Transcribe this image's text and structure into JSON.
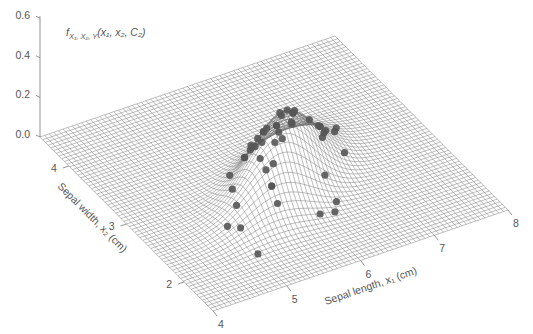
{
  "chart_data": {
    "type": "surface3d+scatter",
    "title": "",
    "zlabel": "f_{X1,X2,Y}(x1, x2, C2)",
    "zlabel_parts": {
      "f": "f",
      "sub": "X₁, X₂, Y",
      "args": "(x₁, x₂, C₂)"
    },
    "xlabel": "Sepal length, x₁ (cm)",
    "ylabel": "Sepal width, x₂ (cm)",
    "x_ticks": [
      4,
      5,
      6,
      7,
      8
    ],
    "y_ticks": [
      2,
      3,
      4
    ],
    "z_ticks": [
      "0.0",
      "0.2",
      "0.4",
      "0.6"
    ],
    "xlim": [
      4,
      8
    ],
    "ylim": [
      1.5,
      4.5
    ],
    "zlim": [
      0,
      0.6
    ],
    "surface": {
      "kind": "bivariate gaussian density",
      "mean": [
        5.94,
        2.77
      ],
      "std": [
        0.52,
        0.31
      ],
      "corr": 0.53,
      "peak": 0.37,
      "grid_color": "#6e6e6e"
    },
    "points_color": "#555555",
    "points_label": "Class C2 samples (Versicolor)",
    "points": [
      [
        7.0,
        3.2
      ],
      [
        6.4,
        3.2
      ],
      [
        6.9,
        3.1
      ],
      [
        5.5,
        2.3
      ],
      [
        6.5,
        2.8
      ],
      [
        5.7,
        2.8
      ],
      [
        6.3,
        3.3
      ],
      [
        4.9,
        2.4
      ],
      [
        6.6,
        2.9
      ],
      [
        5.2,
        2.7
      ],
      [
        5.0,
        2.0
      ],
      [
        5.9,
        3.0
      ],
      [
        6.0,
        2.2
      ],
      [
        6.1,
        2.9
      ],
      [
        5.6,
        2.9
      ],
      [
        6.7,
        3.1
      ],
      [
        5.6,
        3.0
      ],
      [
        5.8,
        2.7
      ],
      [
        6.2,
        2.2
      ],
      [
        5.6,
        2.5
      ],
      [
        5.9,
        3.2
      ],
      [
        6.1,
        2.8
      ],
      [
        6.3,
        2.5
      ],
      [
        6.1,
        2.8
      ],
      [
        6.4,
        2.9
      ],
      [
        6.6,
        3.0
      ],
      [
        6.8,
        2.8
      ],
      [
        6.7,
        3.0
      ],
      [
        6.0,
        2.9
      ],
      [
        5.7,
        2.6
      ],
      [
        5.5,
        2.4
      ],
      [
        5.5,
        2.4
      ],
      [
        5.8,
        2.7
      ],
      [
        6.0,
        2.7
      ],
      [
        5.4,
        3.0
      ],
      [
        6.0,
        3.4
      ],
      [
        6.7,
        3.1
      ],
      [
        6.3,
        2.3
      ],
      [
        5.6,
        3.0
      ],
      [
        5.5,
        2.5
      ],
      [
        5.5,
        2.6
      ],
      [
        6.1,
        3.0
      ],
      [
        5.8,
        2.6
      ],
      [
        5.0,
        2.3
      ],
      [
        5.6,
        2.7
      ],
      [
        5.7,
        3.0
      ],
      [
        5.7,
        2.9
      ],
      [
        6.2,
        2.9
      ],
      [
        5.1,
        2.5
      ],
      [
        5.7,
        2.8
      ]
    ]
  }
}
